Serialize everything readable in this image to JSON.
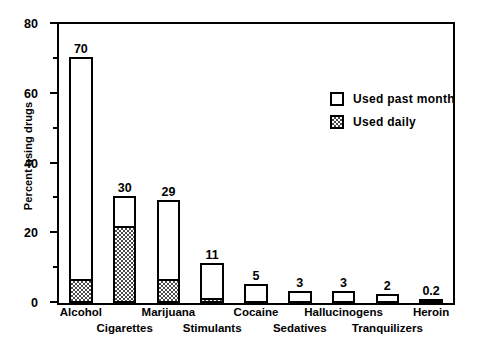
{
  "chart_data": {
    "type": "bar",
    "title": "",
    "subtitle": "",
    "xlabel": "",
    "ylabel": "Percent using drugs",
    "ylim": [
      0,
      80
    ],
    "grid": false,
    "stacked": true,
    "legend_position": "inside-upper-right",
    "y_ticks_major": [
      0,
      20,
      40,
      60,
      80
    ],
    "y_ticks_minor": [
      10,
      30,
      50,
      70
    ],
    "y_tick_labels": [
      "0",
      "20",
      "40",
      "60",
      "80"
    ],
    "categories": [
      "Alcohol",
      "Cigarettes",
      "Marijuana",
      "Stimulants",
      "Cocaine",
      "Sedatives",
      "Hallucinogens",
      "Tranquilizers",
      "Heroin"
    ],
    "series": [
      {
        "name": "Used past month",
        "style": "open",
        "values": [
          70,
          30,
          29,
          11,
          5,
          3,
          3,
          2,
          0.2
        ],
        "value_labels": [
          "70",
          "30",
          "29",
          "11",
          "5",
          "3",
          "3",
          "2",
          "0.2"
        ]
      },
      {
        "name": "Used daily",
        "style": "hatched",
        "values": [
          6.5,
          22,
          6.5,
          1,
          0,
          0,
          0,
          0,
          0
        ],
        "value_labels": [
          "",
          "",
          "",
          "",
          "",
          "",
          "",
          "",
          ""
        ]
      }
    ],
    "legend": [
      {
        "label": "Used past month",
        "style": "open"
      },
      {
        "label": "Used daily",
        "style": "hatched"
      }
    ],
    "label_rows": [
      0,
      1,
      0,
      1,
      0,
      1,
      0,
      1,
      0
    ],
    "colors": {
      "axis": "#000000",
      "bar_outline": "#000000",
      "bar_fill_open": "#ffffff",
      "bar_fill_daily": "#4a4a4a",
      "background": "#ffffff"
    }
  }
}
